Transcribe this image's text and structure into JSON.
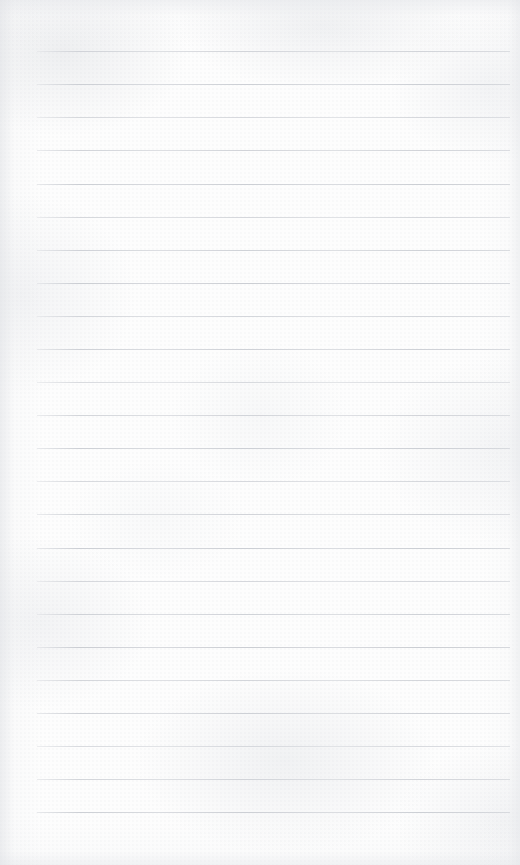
{
  "document": {
    "kind": "lined-paper-sheet",
    "title": "Blank Ruled Notebook Page",
    "content_text": "",
    "has_handwriting": false,
    "has_printed_text": false,
    "page_width": 520,
    "page_height": 865
  },
  "paper": {
    "background_color": "#fdfdfd",
    "edge_shadow_color": "#dee0e4",
    "texture": "subtle mottled scan grain"
  },
  "ruling": {
    "line_color": "#c9ccd2",
    "line_thickness_px": 1,
    "line_spacing_px": 33.1,
    "first_line_y": 51,
    "line_left_x": 37,
    "line_right_x": 510,
    "line_count": 24,
    "margin_rule_visible": false,
    "lines": [
      {
        "index": 1,
        "y": 51,
        "text": ""
      },
      {
        "index": 2,
        "y": 84,
        "text": ""
      },
      {
        "index": 3,
        "y": 117,
        "text": ""
      },
      {
        "index": 4,
        "y": 150,
        "text": ""
      },
      {
        "index": 5,
        "y": 184,
        "text": ""
      },
      {
        "index": 6,
        "y": 217,
        "text": ""
      },
      {
        "index": 7,
        "y": 250,
        "text": ""
      },
      {
        "index": 8,
        "y": 283,
        "text": ""
      },
      {
        "index": 9,
        "y": 316,
        "text": ""
      },
      {
        "index": 10,
        "y": 349,
        "text": ""
      },
      {
        "index": 11,
        "y": 382,
        "text": ""
      },
      {
        "index": 12,
        "y": 415,
        "text": ""
      },
      {
        "index": 13,
        "y": 448,
        "text": ""
      },
      {
        "index": 14,
        "y": 481,
        "text": ""
      },
      {
        "index": 15,
        "y": 514,
        "text": ""
      },
      {
        "index": 16,
        "y": 548,
        "text": ""
      },
      {
        "index": 17,
        "y": 581,
        "text": ""
      },
      {
        "index": 18,
        "y": 614,
        "text": ""
      },
      {
        "index": 19,
        "y": 647,
        "text": ""
      },
      {
        "index": 20,
        "y": 680,
        "text": ""
      },
      {
        "index": 21,
        "y": 713,
        "text": ""
      },
      {
        "index": 22,
        "y": 746,
        "text": ""
      },
      {
        "index": 23,
        "y": 779,
        "text": ""
      },
      {
        "index": 24,
        "y": 812,
        "text": ""
      }
    ]
  }
}
